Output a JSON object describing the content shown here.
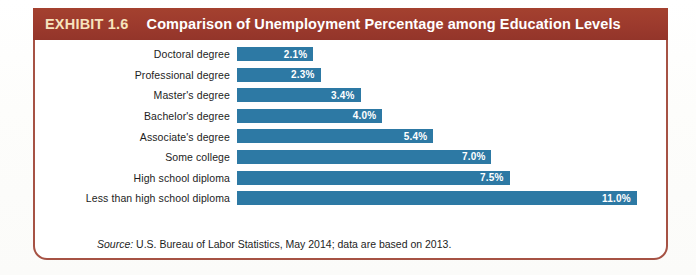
{
  "header": {
    "exhibit_tag": "EXHIBIT 1.6",
    "title": "Comparison of Unemployment Percentage among Education Levels",
    "background_color": "#9e3b2e",
    "tag_color": "#f7e3bd",
    "title_color": "#ffffff"
  },
  "source": {
    "label": "Source:",
    "text": "U.S. Bureau of Labor Statistics, May 2014; data are based on 2013."
  },
  "style": {
    "bar_color": "#2d79a4",
    "frame_border_color": "#a65244",
    "label_color": "#1d1d1d",
    "value_color": "#ffffff"
  },
  "chart_data": {
    "type": "bar",
    "orientation": "horizontal",
    "title": "Comparison of Unemployment Percentage among Education Levels",
    "xlabel": "",
    "ylabel": "",
    "xlim": [
      0,
      11.8
    ],
    "grid": false,
    "legend": "none",
    "value_suffix": "%",
    "categories": [
      "Doctoral degree",
      "Professional degree",
      "Master's degree",
      "Bachelor's degree",
      "Associate's degree",
      "Some college",
      "High school diploma",
      "Less than high school diploma"
    ],
    "values": [
      2.1,
      2.3,
      3.4,
      4.0,
      5.4,
      7.0,
      7.5,
      11.0
    ],
    "value_labels": [
      "2.1%",
      "2.3%",
      "3.4%",
      "4.0%",
      "5.4%",
      "7.0%",
      "7.5%",
      "11.0%"
    ],
    "rows": [
      {
        "category": "Doctoral degree",
        "value": 2.1,
        "label": "2.1%"
      },
      {
        "category": "Professional degree",
        "value": 2.3,
        "label": "2.3%"
      },
      {
        "category": "Master's degree",
        "value": 3.4,
        "label": "3.4%"
      },
      {
        "category": "Bachelor's degree",
        "value": 4.0,
        "label": "4.0%"
      },
      {
        "category": "Associate's degree",
        "value": 5.4,
        "label": "5.4%"
      },
      {
        "category": "Some college",
        "value": 7.0,
        "label": "7.0%"
      },
      {
        "category": "High school diploma",
        "value": 7.5,
        "label": "7.5%"
      },
      {
        "category": "Less than high school diploma",
        "value": 11.0,
        "label": "11.0%"
      }
    ]
  }
}
